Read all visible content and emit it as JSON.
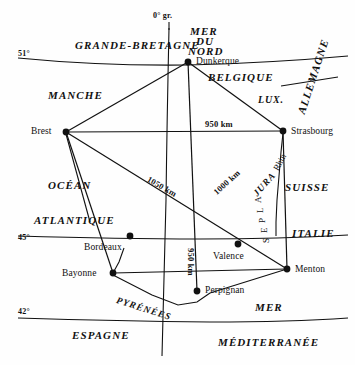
{
  "map": {
    "title": "Carte de France – distances entre villes frontières",
    "width": 355,
    "height": 365,
    "background_color": "#fefefe",
    "ink_color": "#111111"
  },
  "coordinates": {
    "meridian_label": "0° gr.",
    "parallels": [
      {
        "label": "51°",
        "x": 18,
        "y": 50
      },
      {
        "label": "45°",
        "x": 18,
        "y": 234
      },
      {
        "label": "42°",
        "x": 18,
        "y": 308
      }
    ]
  },
  "cities": [
    {
      "name": "Dunkerque",
      "x": 188,
      "y": 62,
      "label_x": 196,
      "label_y": 57
    },
    {
      "name": "Brest",
      "x": 66,
      "y": 132,
      "label_x": 31,
      "label_y": 127
    },
    {
      "name": "Strasbourg",
      "x": 283,
      "y": 131,
      "label_x": 291,
      "label_y": 127
    },
    {
      "name": "Bordeaux",
      "x": 130,
      "y": 236,
      "label_x": 84,
      "label_y": 243
    },
    {
      "name": "Bayonne",
      "x": 113,
      "y": 273,
      "label_x": 62,
      "label_y": 269
    },
    {
      "name": "Valence",
      "x": 238,
      "y": 244,
      "label_x": 213,
      "label_y": 252
    },
    {
      "name": "Menton",
      "x": 287,
      "y": 269,
      "label_x": 295,
      "label_y": 265
    },
    {
      "name": "Perpignan",
      "x": 197,
      "y": 291,
      "label_x": 205,
      "label_y": 286
    }
  ],
  "distances": [
    {
      "label": "950 km",
      "x": 205,
      "y": 120,
      "rotate": 0,
      "note": "Brest–Strasbourg"
    },
    {
      "label": "1050 km",
      "x": 150,
      "y": 175,
      "rotate": 30,
      "note": "Brest–Menton"
    },
    {
      "label": "1000 km",
      "x": 212,
      "y": 190,
      "rotate": -42,
      "note": "Dunkerque–Perpignan"
    },
    {
      "label": "950 km",
      "x": 195,
      "y": 248,
      "rotate": 90,
      "note": "Dunkerque–Perpignan vertical"
    }
  ],
  "regions": [
    {
      "label": "GRANDE-BRETAGNE",
      "x": 75,
      "y": 40,
      "rotate": 0,
      "size": "region"
    },
    {
      "label": "MER",
      "x": 190,
      "y": 26,
      "rotate": 0,
      "size": "region"
    },
    {
      "label": "DU",
      "x": 196,
      "y": 36,
      "rotate": 0,
      "size": "region"
    },
    {
      "label": "NORD",
      "x": 188,
      "y": 46,
      "rotate": 0,
      "size": "region"
    },
    {
      "label": "BELGIQUE",
      "x": 208,
      "y": 72,
      "rotate": 0,
      "size": "region"
    },
    {
      "label": "LUX.",
      "x": 258,
      "y": 95,
      "rotate": 0,
      "size": "region-sm"
    },
    {
      "label": "ALLEMAGNE",
      "x": 296,
      "y": 112,
      "rotate": -72,
      "size": "region"
    },
    {
      "label": "MANCHE",
      "x": 48,
      "y": 90,
      "rotate": 0,
      "size": "region"
    },
    {
      "label": "OCÉAN",
      "x": 48,
      "y": 180,
      "rotate": 0,
      "size": "region"
    },
    {
      "label": "ATLANTIQUE",
      "x": 34,
      "y": 215,
      "rotate": 0,
      "size": "region"
    },
    {
      "label": "SUISSE",
      "x": 285,
      "y": 182,
      "rotate": 0,
      "size": "region"
    },
    {
      "label": "ITALIE",
      "x": 292,
      "y": 228,
      "rotate": 0,
      "size": "region"
    },
    {
      "label": "ESPAGNE",
      "x": 72,
      "y": 330,
      "rotate": 0,
      "size": "region"
    },
    {
      "label": "MER",
      "x": 255,
      "y": 302,
      "rotate": 0,
      "size": "region"
    },
    {
      "label": "MÉDITERRANÉE",
      "x": 218,
      "y": 337,
      "rotate": 0,
      "size": "region"
    }
  ],
  "mountains": [
    {
      "label": "PYRÉNÉES",
      "x": 118,
      "y": 296,
      "rotate": 18,
      "style": "mountain"
    },
    {
      "label": "JURA",
      "x": 252,
      "y": 192,
      "rotate": -48,
      "style": "mountain"
    },
    {
      "label": "Rhin",
      "x": 272,
      "y": 168,
      "rotate": -62,
      "style": "alps"
    }
  ],
  "alps_letters": [
    {
      "ch": "A",
      "x": 254,
      "y": 203
    },
    {
      "ch": "L",
      "x": 256,
      "y": 213
    },
    {
      "ch": "P",
      "x": 258,
      "y": 223
    },
    {
      "ch": "E",
      "x": 260,
      "y": 233
    },
    {
      "ch": "S",
      "x": 262,
      "y": 243
    }
  ],
  "network": {
    "hub_note": "lines radiate from Dunkerque, Brest, Strasbourg, Menton, Bayonne, Perpignan",
    "segments": [
      "Brest–Dunkerque",
      "Dunkerque–Strasbourg",
      "Brest–Strasbourg",
      "Brest–Menton",
      "Dunkerque–Perpignan",
      "Brest–Bayonne",
      "Bayonne–Menton",
      "Bayonne–Perpignan-coast",
      "Strasbourg–Menton"
    ]
  }
}
